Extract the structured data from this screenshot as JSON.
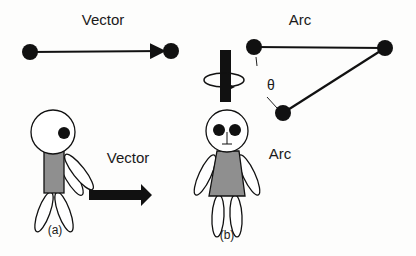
{
  "panels": {
    "top_left": {
      "title": "Vector"
    },
    "top_right": {
      "title": "Arc",
      "angle_symbol": "θ"
    },
    "figure_a": {
      "caption": "(a)",
      "motion_label": "Vector"
    },
    "figure_b": {
      "caption": "(b)",
      "motion_label": "Arc"
    }
  },
  "colors": {
    "ink": "#111111",
    "body_fill": "#8f8f8f",
    "background": "#fdfdfc"
  }
}
